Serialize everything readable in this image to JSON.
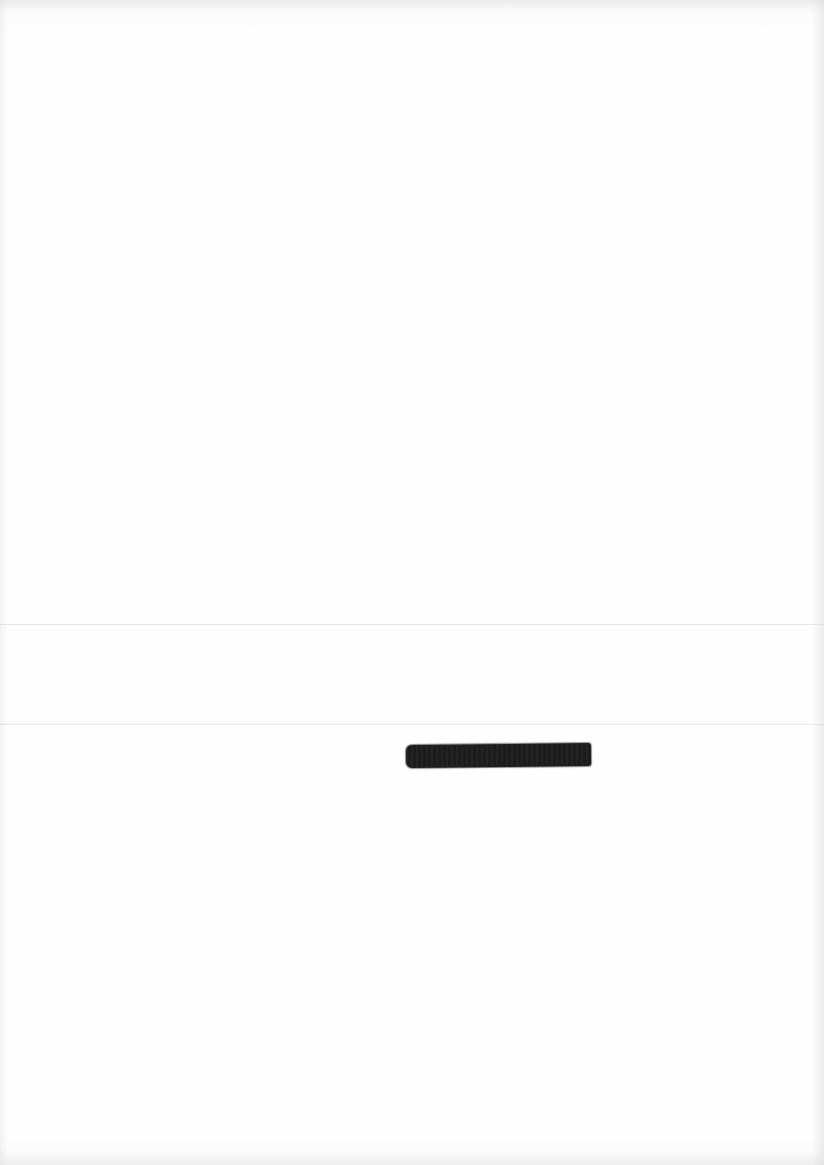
{
  "document": {
    "type": "scanned-page",
    "text_content": "",
    "redactions": [
      {
        "label": "redacted",
        "color": "#1c1c1c"
      }
    ],
    "background_color": "#fefefe"
  }
}
